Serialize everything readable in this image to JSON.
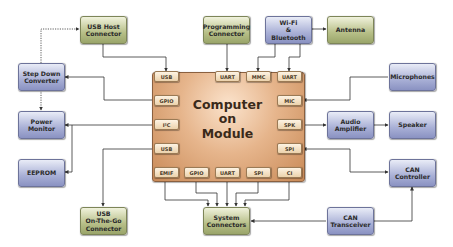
{
  "diagram": {
    "center": {
      "line1": "Computer",
      "line2": "on",
      "line3": "Module"
    },
    "ports": {
      "top": [
        "USB",
        "UART",
        "MMC",
        "UART"
      ],
      "left": [
        "GPIO",
        "I²C",
        "USB"
      ],
      "right": [
        "MIC",
        "SPK",
        "SPI"
      ],
      "bottom": [
        "EMIF",
        "GPIO",
        "UART",
        "SPI",
        "CI"
      ]
    },
    "blocks": {
      "usb_host": {
        "line1": "USB Host",
        "line2": "Connector"
      },
      "programming": {
        "line1": "Programming",
        "line2": "Connector"
      },
      "wifi": {
        "line1": "Wi-Fi",
        "line2": "&",
        "line3": "Bluetooth"
      },
      "antenna": {
        "label": "Antenna"
      },
      "step_down": {
        "line1": "Step Down",
        "line2": "Converter"
      },
      "microphones": {
        "label": "Microphones"
      },
      "power_monitor": {
        "line1": "Power",
        "line2": "Monitor"
      },
      "audio_amp": {
        "line1": "Audio",
        "line2": "Amplifier"
      },
      "speaker": {
        "label": "Speaker"
      },
      "eeprom": {
        "label": "EEPROM"
      },
      "can_controller": {
        "line1": "CAN",
        "line2": "Controller"
      },
      "usb_otg": {
        "line1": "USB",
        "line2": "On-The-Go",
        "line3": "Connector"
      },
      "system_connectors": {
        "line1": "System",
        "line2": "Connectors"
      },
      "can_transceiver": {
        "line1": "CAN",
        "line2": "Transceiver"
      }
    },
    "colors": {
      "green_block": "#b7bf88",
      "blue_block": "#a9b0d6",
      "module": "#e6b58c",
      "port": "#ecd2ac",
      "wire": "#333333"
    }
  }
}
